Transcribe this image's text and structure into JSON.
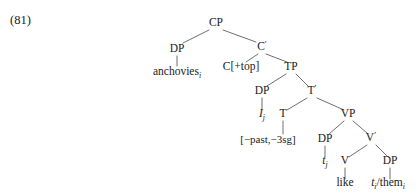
{
  "example": {
    "number_label": "(81)"
  },
  "diagram": {
    "type": "syntax-tree",
    "notation": "X-bar phrase structure tree",
    "line_color": "#4a4a4a",
    "text_color": "#1a1a1a",
    "background_color": "#ffffff"
  },
  "nodes": {
    "cp": {
      "label": "CP",
      "x": 216,
      "y": 26
    },
    "dp_topic": {
      "label": "DP",
      "x": 177,
      "y": 52
    },
    "anchovies": {
      "base": "anchovies",
      "subscript": "i",
      "x": 177,
      "y": 75
    },
    "cbar": {
      "base": "C",
      "prime": "′",
      "x": 262,
      "y": 50
    },
    "c_head": {
      "label": "C[+top]",
      "x": 241,
      "y": 70
    },
    "tp": {
      "label": "TP",
      "x": 291,
      "y": 70
    },
    "dp_subject": {
      "label": "DP",
      "x": 262,
      "y": 94
    },
    "i_trace_subject": {
      "base": "I",
      "subscript": "j",
      "x": 262,
      "y": 117
    },
    "tbar": {
      "base": "T",
      "prime": "′",
      "x": 312,
      "y": 94
    },
    "t_head": {
      "label": "T",
      "x": 283,
      "y": 117
    },
    "t_features": {
      "label": "[−past,−3sg]",
      "x": 268,
      "y": 143
    },
    "vp": {
      "label": "VP",
      "x": 348,
      "y": 117
    },
    "dp_vp_spec": {
      "label": "DP",
      "x": 325,
      "y": 142
    },
    "t_trace_vp": {
      "base": "t",
      "subscript": "j",
      "x": 325,
      "y": 164
    },
    "vbar": {
      "base": "V",
      "prime": "′",
      "x": 371,
      "y": 141
    },
    "v_head": {
      "label": "V",
      "x": 345,
      "y": 164
    },
    "like": {
      "label": "like",
      "x": 345,
      "y": 186
    },
    "dp_object": {
      "label": "DP",
      "x": 390,
      "y": 164
    },
    "them_trace": {
      "trace": "t",
      "trace_subscript": "i",
      "separator": "/",
      "pronoun": "them",
      "pronoun_subscript": "i",
      "x": 388,
      "y": 186
    }
  },
  "edges": [
    {
      "from": "cp",
      "to": "dp_topic"
    },
    {
      "from": "cp",
      "to": "cbar"
    },
    {
      "from": "dp_topic",
      "to": "anchovies"
    },
    {
      "from": "cbar",
      "to": "c_head"
    },
    {
      "from": "cbar",
      "to": "tp"
    },
    {
      "from": "tp",
      "to": "dp_subject"
    },
    {
      "from": "tp",
      "to": "tbar"
    },
    {
      "from": "dp_subject",
      "to": "i_trace_subject"
    },
    {
      "from": "tbar",
      "to": "t_head"
    },
    {
      "from": "tbar",
      "to": "vp"
    },
    {
      "from": "t_head",
      "to": "t_features"
    },
    {
      "from": "vp",
      "to": "dp_vp_spec"
    },
    {
      "from": "vp",
      "to": "vbar"
    },
    {
      "from": "dp_vp_spec",
      "to": "t_trace_vp"
    },
    {
      "from": "vbar",
      "to": "v_head"
    },
    {
      "from": "vbar",
      "to": "dp_object"
    },
    {
      "from": "v_head",
      "to": "like"
    },
    {
      "from": "dp_object",
      "to": "them_trace"
    }
  ]
}
